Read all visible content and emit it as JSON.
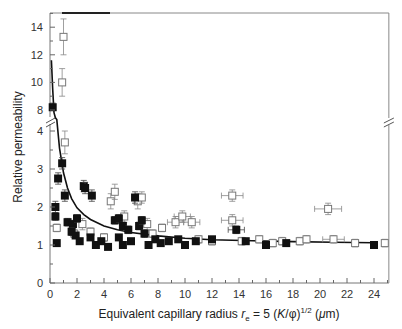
{
  "chart_data": {
    "type": "scatter",
    "title": "",
    "xlabel": "Equivalent capillary radius r_e = 5 (K/φ)^1/2 (μm)",
    "xlabel_parts": {
      "pre": "Equivalent capillary radius ",
      "var": "r",
      "sub": "e",
      "mid": " = 5 (",
      "k": "K",
      "slash": "/φ)",
      "sup": "1/2",
      "post": " (",
      "mu": "μ",
      "unit": "m)"
    },
    "ylabel": "Relative permeability",
    "xlim": [
      0,
      25
    ],
    "ylim_lower": [
      0,
      4
    ],
    "ylim_upper": [
      8,
      15
    ],
    "axis_break": "y-axis broken between 4 and 8",
    "grid": false,
    "legend": "none",
    "x_ticks": [
      0,
      2,
      4,
      6,
      8,
      10,
      12,
      14,
      16,
      18,
      20,
      22,
      24
    ],
    "x_tick_labels": [
      "0",
      "2",
      "4",
      "6",
      "8",
      "10",
      "12",
      "14",
      "16",
      "18",
      "20",
      "22",
      "24"
    ],
    "y_ticks_lower": [
      0,
      1,
      2,
      3,
      4
    ],
    "y_tick_labels_lower": [
      "0",
      "1",
      "2",
      "3",
      "4"
    ],
    "y_ticks_upper": [
      8,
      10,
      12,
      14
    ],
    "y_tick_labels_upper": [
      "8",
      "10",
      "12",
      "14"
    ],
    "series": [
      {
        "name": "open squares (with error bars)",
        "marker": "open-square",
        "points": [
          {
            "x": 1.0,
            "y": 13.3,
            "ey": 1.3
          },
          {
            "x": 0.9,
            "y": 10.0,
            "ey": 1.0
          },
          {
            "x": 1.1,
            "y": 3.7,
            "ey": 0.3
          },
          {
            "x": 0.5,
            "y": 1.45,
            "ey": 0.1
          },
          {
            "x": 1.8,
            "y": 1.3,
            "ey": 0.1
          },
          {
            "x": 2.4,
            "y": 1.55,
            "ey": 0.15
          },
          {
            "x": 3.0,
            "y": 1.35,
            "ey": 0.1
          },
          {
            "x": 4.0,
            "y": 1.2,
            "ey": 0.1
          },
          {
            "x": 4.5,
            "y": 2.15,
            "ey": 0.2
          },
          {
            "x": 4.8,
            "y": 2.4,
            "ey": 0.2
          },
          {
            "x": 5.5,
            "y": 1.75,
            "ey": 0.15
          },
          {
            "x": 6.5,
            "y": 2.15,
            "ey": 0.2
          },
          {
            "x": 6.8,
            "y": 2.25,
            "ey": 0.15
          },
          {
            "x": 7.2,
            "y": 1.55,
            "ey": 0.15
          },
          {
            "x": 7.6,
            "y": 1.3,
            "ey": 0.1
          },
          {
            "x": 8.3,
            "y": 1.45,
            "ey": 0.1
          },
          {
            "x": 9.3,
            "y": 1.6,
            "ey": 0.15,
            "ex": 0.6
          },
          {
            "x": 9.8,
            "y": 1.75,
            "ey": 0.15,
            "ex": 0.6
          },
          {
            "x": 10.5,
            "y": 1.6,
            "ey": 0.15,
            "ex": 0.6
          },
          {
            "x": 11.0,
            "y": 1.15,
            "ey": 0.1
          },
          {
            "x": 12.0,
            "y": 1.1,
            "ey": 0.1
          },
          {
            "x": 13.5,
            "y": 2.3,
            "ey": 0.15,
            "ex": 0.8
          },
          {
            "x": 13.5,
            "y": 1.65,
            "ey": 0.15,
            "ex": 0.8
          },
          {
            "x": 14.2,
            "y": 1.1,
            "ey": 0.1
          },
          {
            "x": 15.5,
            "y": 1.15,
            "ey": 0.1
          },
          {
            "x": 16.5,
            "y": 1.05,
            "ey": 0.1
          },
          {
            "x": 17.2,
            "y": 1.1,
            "ey": 0.1
          },
          {
            "x": 18.5,
            "y": 1.1,
            "ey": 0.1
          },
          {
            "x": 19.0,
            "y": 1.15,
            "ey": 0.1
          },
          {
            "x": 20.6,
            "y": 1.95,
            "ey": 0.15,
            "ex": 1.0
          },
          {
            "x": 21.0,
            "y": 1.15,
            "ey": 0.1,
            "ex": 0.8
          },
          {
            "x": 22.6,
            "y": 1.05,
            "ey": 0.1
          },
          {
            "x": 24.8,
            "y": 1.05,
            "ey": 0.1
          }
        ]
      },
      {
        "name": "filled squares",
        "marker": "filled-square",
        "points": [
          {
            "x": 0.2,
            "y": 8.2,
            "ey": 0.3
          },
          {
            "x": 0.9,
            "y": 3.15,
            "ey": 0.15
          },
          {
            "x": 0.6,
            "y": 2.75,
            "ey": 0.15
          },
          {
            "x": 1.1,
            "y": 2.3,
            "ey": 0.15
          },
          {
            "x": 0.4,
            "y": 2.0,
            "ey": 0.15
          },
          {
            "x": 0.4,
            "y": 1.75,
            "ey": 0.1
          },
          {
            "x": 0.5,
            "y": 1.05,
            "ey": 0.05
          },
          {
            "x": 1.3,
            "y": 1.6,
            "ey": 0.1
          },
          {
            "x": 1.7,
            "y": 1.55,
            "ey": 0.1
          },
          {
            "x": 2.0,
            "y": 1.7,
            "ey": 0.1
          },
          {
            "x": 1.6,
            "y": 1.35,
            "ey": 0.1
          },
          {
            "x": 1.9,
            "y": 1.25,
            "ey": 0.05
          },
          {
            "x": 2.2,
            "y": 1.1,
            "ey": 0.05
          },
          {
            "x": 2.5,
            "y": 2.55,
            "ey": 0.15
          },
          {
            "x": 2.6,
            "y": 2.5,
            "ey": 0.15
          },
          {
            "x": 3.1,
            "y": 2.3,
            "ey": 0.15
          },
          {
            "x": 3.0,
            "y": 1.2,
            "ey": 0.05
          },
          {
            "x": 3.4,
            "y": 1.0,
            "ey": 0.05
          },
          {
            "x": 3.8,
            "y": 1.1,
            "ey": 0.05
          },
          {
            "x": 4.3,
            "y": 0.95,
            "ey": 0.05
          },
          {
            "x": 4.8,
            "y": 1.65,
            "ey": 0.1
          },
          {
            "x": 5.1,
            "y": 1.7,
            "ey": 0.1
          },
          {
            "x": 5.4,
            "y": 1.5,
            "ey": 0.1
          },
          {
            "x": 5.8,
            "y": 1.4,
            "ey": 0.1
          },
          {
            "x": 5.1,
            "y": 1.2,
            "ey": 0.05
          },
          {
            "x": 5.4,
            "y": 1.0,
            "ey": 0.05
          },
          {
            "x": 6.0,
            "y": 1.1,
            "ey": 0.05
          },
          {
            "x": 6.3,
            "y": 2.25,
            "ey": 0.15
          },
          {
            "x": 6.6,
            "y": 1.5,
            "ey": 0.1
          },
          {
            "x": 6.8,
            "y": 1.65,
            "ey": 0.1
          },
          {
            "x": 7.0,
            "y": 1.3,
            "ey": 0.1
          },
          {
            "x": 7.3,
            "y": 1.0,
            "ey": 0.05
          },
          {
            "x": 7.8,
            "y": 1.15,
            "ey": 0.05
          },
          {
            "x": 8.2,
            "y": 1.05,
            "ey": 0.05
          },
          {
            "x": 8.8,
            "y": 1.1,
            "ey": 0.05
          },
          {
            "x": 9.5,
            "y": 1.15,
            "ey": 0.05
          },
          {
            "x": 10.0,
            "y": 1.0,
            "ey": 0.05
          },
          {
            "x": 10.8,
            "y": 1.1,
            "ey": 0.05
          },
          {
            "x": 12.0,
            "y": 1.15,
            "ey": 0.05
          },
          {
            "x": 13.8,
            "y": 1.4,
            "ey": 0.1,
            "ex": 0.6
          },
          {
            "x": 14.5,
            "y": 1.1,
            "ey": 0.05
          },
          {
            "x": 16.0,
            "y": 1.0,
            "ey": 0.05
          },
          {
            "x": 17.5,
            "y": 1.05,
            "ey": 0.05
          },
          {
            "x": 24.0,
            "y": 1.0,
            "ey": 0.05
          }
        ]
      },
      {
        "name": "fit curve",
        "type": "line",
        "x": [
          0.1,
          0.2,
          0.3,
          0.4,
          0.5,
          0.7,
          1.0,
          1.3,
          1.6,
          2.0,
          2.5,
          3.0,
          4.0,
          5.0,
          6.0,
          8.0,
          10.0,
          12.0,
          15.0,
          18.0,
          21.0,
          24.0
        ],
        "y": [
          11.6,
          9.5,
          7.0,
          5.0,
          4.3,
          3.55,
          2.9,
          2.5,
          2.22,
          1.98,
          1.8,
          1.67,
          1.5,
          1.4,
          1.33,
          1.24,
          1.18,
          1.14,
          1.11,
          1.09,
          1.07,
          1.06
        ]
      }
    ]
  }
}
